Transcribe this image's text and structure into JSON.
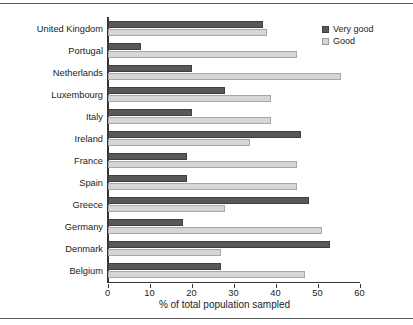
{
  "figure": {
    "background_color": "#ffffff",
    "has_top_rule": true,
    "has_bottom_rule": true
  },
  "legend": {
    "position": "top-right",
    "items": [
      {
        "label": "Very good",
        "color": "#585858",
        "swatch_icon": "filled-square-icon"
      },
      {
        "label": "Good",
        "color": "#d6d6d6",
        "swatch_icon": "filled-square-icon"
      }
    ]
  },
  "axes": {
    "x_title": "% of total population sampled",
    "x_ticks": [
      "0",
      "10",
      "20",
      "30",
      "40",
      "50",
      "60"
    ],
    "y_title": ""
  },
  "chart_data": {
    "type": "bar",
    "orientation": "horizontal",
    "title": "",
    "subtitle": "",
    "xlabel": "% of total population sampled",
    "ylabel": "",
    "xlim": [
      0,
      60
    ],
    "xticks": [
      0,
      10,
      20,
      30,
      40,
      50,
      60
    ],
    "grid": false,
    "legend_position": "top-right",
    "categories": [
      "United Kingdom",
      "Portugal",
      "Netherlands",
      "Luxembourg",
      "Italy",
      "Ireland",
      "France",
      "Spain",
      "Greece",
      "Germany",
      "Denmark",
      "Belgium"
    ],
    "series": [
      {
        "name": "Very good",
        "color": "#585858",
        "values": [
          37,
          8,
          20,
          28,
          20,
          46,
          19,
          19,
          48,
          18,
          53,
          27
        ]
      },
      {
        "name": "Good",
        "color": "#d6d6d6",
        "values": [
          38,
          45,
          55.5,
          39,
          39,
          34,
          45,
          45,
          28,
          51,
          27,
          47
        ]
      }
    ]
  }
}
